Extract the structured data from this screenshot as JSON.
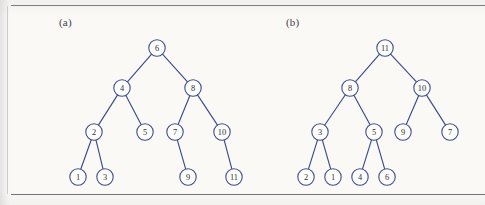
{
  "figure": {
    "background_color": "#faf9f6",
    "ink_color": "#3b4b8f",
    "rule_color": "#6f7076",
    "panels": [
      {
        "id": "a",
        "label": "(a)"
      },
      {
        "id": "b",
        "label": "(b)"
      }
    ]
  },
  "chart_data": {
    "type": "diagram",
    "subtype": "binary-tree",
    "title": "",
    "trees": [
      {
        "panel": "a",
        "label": "(a)",
        "root": "6",
        "nodes": [
          {
            "id": "a6",
            "value": "6",
            "x": 157,
            "y": 48,
            "level": 0
          },
          {
            "id": "a4",
            "value": "4",
            "x": 122,
            "y": 88,
            "level": 1
          },
          {
            "id": "a8",
            "value": "8",
            "x": 193,
            "y": 88,
            "level": 1
          },
          {
            "id": "a2",
            "value": "2",
            "x": 94,
            "y": 132,
            "level": 2
          },
          {
            "id": "a5",
            "value": "5",
            "x": 145,
            "y": 132,
            "level": 2
          },
          {
            "id": "a7",
            "value": "7",
            "x": 175,
            "y": 132,
            "level": 2
          },
          {
            "id": "a10",
            "value": "10",
            "x": 222,
            "y": 132,
            "level": 2
          },
          {
            "id": "a1",
            "value": "1",
            "x": 78,
            "y": 177,
            "level": 3
          },
          {
            "id": "a3",
            "value": "3",
            "x": 105,
            "y": 177,
            "level": 3
          },
          {
            "id": "a9",
            "value": "9",
            "x": 188,
            "y": 177,
            "level": 3
          },
          {
            "id": "a11",
            "value": "11",
            "x": 234,
            "y": 177,
            "level": 3
          }
        ],
        "edges": [
          {
            "from": "a6",
            "to": "a4"
          },
          {
            "from": "a6",
            "to": "a8"
          },
          {
            "from": "a4",
            "to": "a2"
          },
          {
            "from": "a4",
            "to": "a5"
          },
          {
            "from": "a8",
            "to": "a7"
          },
          {
            "from": "a8",
            "to": "a10"
          },
          {
            "from": "a2",
            "to": "a1"
          },
          {
            "from": "a2",
            "to": "a3"
          },
          {
            "from": "a7",
            "to": "a9"
          },
          {
            "from": "a10",
            "to": "a11"
          }
        ]
      },
      {
        "panel": "b",
        "label": "(b)",
        "root": "11",
        "nodes": [
          {
            "id": "b11",
            "value": "11",
            "x": 385,
            "y": 48,
            "level": 0
          },
          {
            "id": "b8",
            "value": "8",
            "x": 350,
            "y": 88,
            "level": 1
          },
          {
            "id": "b10",
            "value": "10",
            "x": 422,
            "y": 88,
            "level": 1
          },
          {
            "id": "b3",
            "value": "3",
            "x": 320,
            "y": 132,
            "level": 2
          },
          {
            "id": "b5",
            "value": "5",
            "x": 374,
            "y": 132,
            "level": 2
          },
          {
            "id": "b9",
            "value": "9",
            "x": 403,
            "y": 132,
            "level": 2
          },
          {
            "id": "b7",
            "value": "7",
            "x": 450,
            "y": 132,
            "level": 2
          },
          {
            "id": "b2",
            "value": "2",
            "x": 306,
            "y": 177,
            "level": 3
          },
          {
            "id": "b1",
            "value": "1",
            "x": 333,
            "y": 177,
            "level": 3
          },
          {
            "id": "b4",
            "value": "4",
            "x": 360,
            "y": 177,
            "level": 3
          },
          {
            "id": "b6",
            "value": "6",
            "x": 387,
            "y": 177,
            "level": 3
          }
        ],
        "edges": [
          {
            "from": "b11",
            "to": "b8"
          },
          {
            "from": "b11",
            "to": "b10"
          },
          {
            "from": "b8",
            "to": "b3"
          },
          {
            "from": "b8",
            "to": "b5"
          },
          {
            "from": "b10",
            "to": "b9"
          },
          {
            "from": "b10",
            "to": "b7"
          },
          {
            "from": "b3",
            "to": "b2"
          },
          {
            "from": "b3",
            "to": "b1"
          },
          {
            "from": "b5",
            "to": "b4"
          },
          {
            "from": "b5",
            "to": "b6"
          }
        ]
      }
    ],
    "node_radius": 8.2,
    "xlabel": "",
    "ylabel": "",
    "legend": []
  }
}
